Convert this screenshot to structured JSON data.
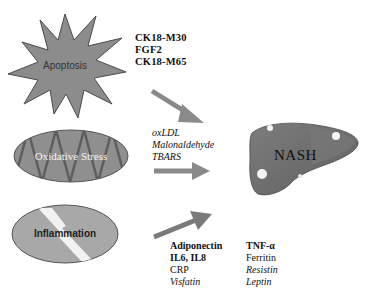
{
  "diagram": {
    "target": {
      "label": "NASH",
      "shape": "liver"
    },
    "colors": {
      "shape_fill": "#8c8c8c",
      "shape_stroke": "#555555",
      "liver_fill": "#6f6f6f",
      "arrow": "#8a8a8a",
      "text": "#111111",
      "background": "#ffffff"
    },
    "sources": [
      {
        "id": "apoptosis",
        "label": "Apoptosis",
        "shape": "starburst",
        "markers": [
          {
            "text": "CK18-M30",
            "style": "bold"
          },
          {
            "text": "FGF2",
            "style": "bold"
          },
          {
            "text": "CK18-M65",
            "style": "bold"
          }
        ]
      },
      {
        "id": "oxidative-stress",
        "label": "Oxidative Stress",
        "shape": "ellipse-zigzag",
        "markers": [
          {
            "text": "oxLDL",
            "style": "italic"
          },
          {
            "text": "Malonaldehyde",
            "style": "italic"
          },
          {
            "text": "TBARS",
            "style": "italic"
          }
        ]
      },
      {
        "id": "inflammation",
        "label": "Inflammation",
        "shape": "ellipse-lightning",
        "markers_col1": [
          {
            "text": "Adiponectin",
            "style": "bold"
          },
          {
            "text": "IL6, IL8",
            "style": "bold"
          },
          {
            "text": "CRP",
            "style": "normal"
          },
          {
            "text": "Visfatin",
            "style": "italic"
          }
        ],
        "markers_col2": [
          {
            "text": "TNF-α",
            "style": "bold"
          },
          {
            "text": "Ferritin",
            "style": "normal"
          },
          {
            "text": "Resistin",
            "style": "italic"
          },
          {
            "text": "Leptin",
            "style": "italic"
          }
        ]
      }
    ]
  }
}
